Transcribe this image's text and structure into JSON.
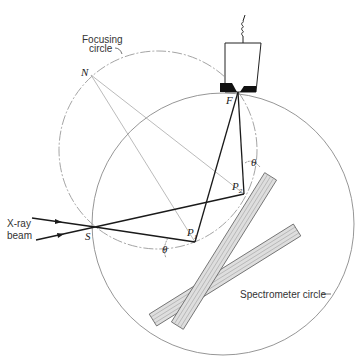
{
  "diagram": {
    "labels": {
      "focusing_circle_line1": "Focusing",
      "focusing_circle_line2": "circle",
      "spectrometer_circle": "Spectrometer circle",
      "xray_line1": "X-ray",
      "xray_line2": "beam",
      "point_N": "N",
      "point_S": "S",
      "point_F": "F",
      "point_P1": "P",
      "point_P1_sub": "1",
      "point_P2": "P",
      "point_P2_sub": "2",
      "theta1": "θ",
      "theta2": "θ"
    },
    "colors": {
      "line": "#222222",
      "thin": "#999999",
      "crystal_fill": "#d9d9d9",
      "crystal_stroke": "#666666",
      "detector_fill": "#111111"
    }
  }
}
